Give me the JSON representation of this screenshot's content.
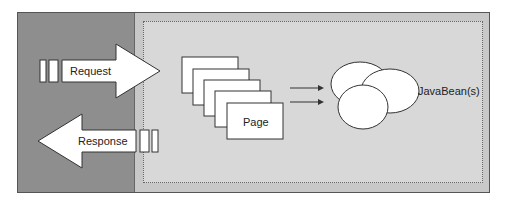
{
  "diagram": {
    "request_label": "Request",
    "response_label": "Response",
    "page_label": "Page",
    "beans_label": "JavaBean(s)"
  },
  "colors": {
    "client_panel": "#8e8e8e",
    "server_panel": "#c8c8c8",
    "inner_area": "#d8d8d8",
    "shape_fill": "#ffffff",
    "stroke": "#333333"
  }
}
